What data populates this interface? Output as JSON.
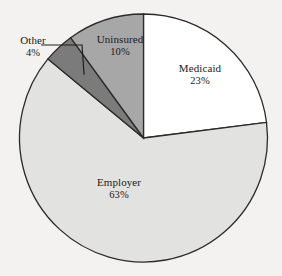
{
  "chart_data": {
    "type": "pie",
    "title": "",
    "subtitle": "",
    "xlabel": "",
    "ylabel": "",
    "legend_position": "none",
    "grid": false,
    "labels_inside": true,
    "start_angle_deg": 0,
    "direction": "clockwise",
    "categories": [
      "Medicaid",
      "Employer",
      "Other",
      "Uninsured"
    ],
    "values": [
      23,
      63,
      4,
      10
    ],
    "value_unit": "%",
    "slices": [
      {
        "name": "Medicaid",
        "value": 23,
        "value_label": "23%",
        "color": "#ffffff",
        "label_placement": "inside"
      },
      {
        "name": "Employer",
        "value": 63,
        "value_label": "63%",
        "color": "#e2e2e0",
        "label_placement": "inside"
      },
      {
        "name": "Other",
        "value": 4,
        "value_label": "4%",
        "color": "#7b7b7b",
        "label_placement": "outside-leader"
      },
      {
        "name": "Uninsured",
        "value": 10,
        "value_label": "10%",
        "color": "#a7a7a7",
        "label_placement": "inside"
      }
    ]
  },
  "style": {
    "background": "#f3f2f0",
    "outline_color": "#2b2b2b",
    "text_color": "#1a1a1a",
    "leader_line_color": "#1f1f1f"
  },
  "geometry": {
    "center_x": 143.5,
    "center_y": 138,
    "radius": 124
  }
}
